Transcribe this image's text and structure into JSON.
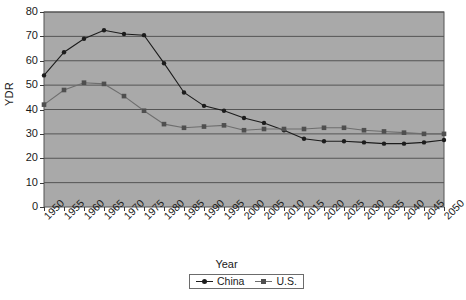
{
  "chart_data": {
    "type": "line",
    "title": "",
    "xlabel": "Year",
    "ylabel": "YDR",
    "xlim": [
      1950,
      2050
    ],
    "ylim": [
      0,
      80
    ],
    "ytick_step": 10,
    "xtick_step": 5,
    "grid": "horizontal",
    "legend_position": "bottom-center",
    "plot_background": "#a9a9a9",
    "categories": [
      "1950",
      "1955",
      "1960",
      "1965",
      "1970",
      "1975",
      "1980",
      "1985",
      "1990",
      "1995",
      "2000",
      "2005",
      "2010",
      "2015",
      "2020",
      "2025",
      "2030",
      "2035",
      "2040",
      "2045",
      "2050"
    ],
    "yticks": [
      "0",
      "10",
      "20",
      "30",
      "40",
      "50",
      "60",
      "70",
      "80"
    ],
    "series": [
      {
        "name": "China",
        "color": "#1c1c1c",
        "marker": "circle",
        "values": [
          54,
          63.5,
          69,
          72.5,
          71,
          70.5,
          59,
          47,
          41.5,
          39.5,
          36.5,
          34.5,
          31.5,
          28,
          27,
          27,
          26.5,
          26,
          26,
          26.5,
          27.5
        ]
      },
      {
        "name": "U.S.",
        "color": "#6e6e6e",
        "marker": "square",
        "values": [
          42,
          48,
          51,
          50.5,
          45.5,
          39.5,
          34,
          32.5,
          33,
          33.5,
          31.5,
          32,
          32,
          32,
          32.5,
          32.5,
          31.5,
          31,
          30.5,
          30,
          30
        ]
      }
    ]
  },
  "axes": {
    "y_title": "YDR",
    "x_title": "Year"
  },
  "legend": {
    "items": [
      {
        "label": "China"
      },
      {
        "label": "U.S."
      }
    ]
  }
}
